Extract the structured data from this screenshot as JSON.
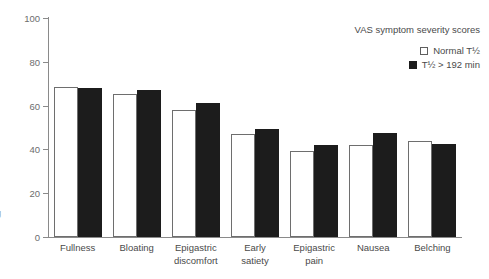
{
  "figure": {
    "edge_clipped_label": "g"
  },
  "legend": {
    "title": "VAS symptom severity scores",
    "entries": [
      {
        "label": "Normal T½",
        "swatch": "open",
        "color": "#ffffff"
      },
      {
        "label": "T½ > 192 min",
        "swatch": "filled",
        "color": "#1c1c1c"
      }
    ]
  },
  "axes": {
    "y_ticks": [
      "0",
      "20",
      "40",
      "60",
      "80",
      "100"
    ],
    "y_min": 0,
    "y_max": 100
  },
  "chart_data": {
    "type": "bar",
    "title": "VAS symptom severity scores",
    "xlabel": "",
    "ylabel": "",
    "ylim": [
      0,
      100
    ],
    "yticks": [
      0,
      20,
      40,
      60,
      80,
      100
    ],
    "grid": false,
    "legend_position": "top-right",
    "categories": [
      "Fullness",
      "Epigastric discomfort",
      "Bloating",
      "Early satiety",
      "Epigastric pain",
      "Nausea",
      "Belching"
    ],
    "category_lines": [
      [
        "Fullness",
        ""
      ],
      [
        "Bloating",
        ""
      ],
      [
        "Epigastric",
        "discomfort"
      ],
      [
        "Early",
        "satiety"
      ],
      [
        "Epigastric",
        "pain"
      ],
      [
        "Nausea",
        ""
      ],
      [
        "Belching",
        ""
      ]
    ],
    "series": [
      {
        "name": "Normal T½",
        "color": "#ffffff",
        "values": [
          68.5,
          65.5,
          58,
          47,
          39.5,
          42,
          44
        ]
      },
      {
        "name": "T½ > 192 min",
        "color": "#1c1c1c",
        "values": [
          68,
          67,
          61,
          49.5,
          42,
          47.5,
          42.5
        ]
      }
    ]
  }
}
